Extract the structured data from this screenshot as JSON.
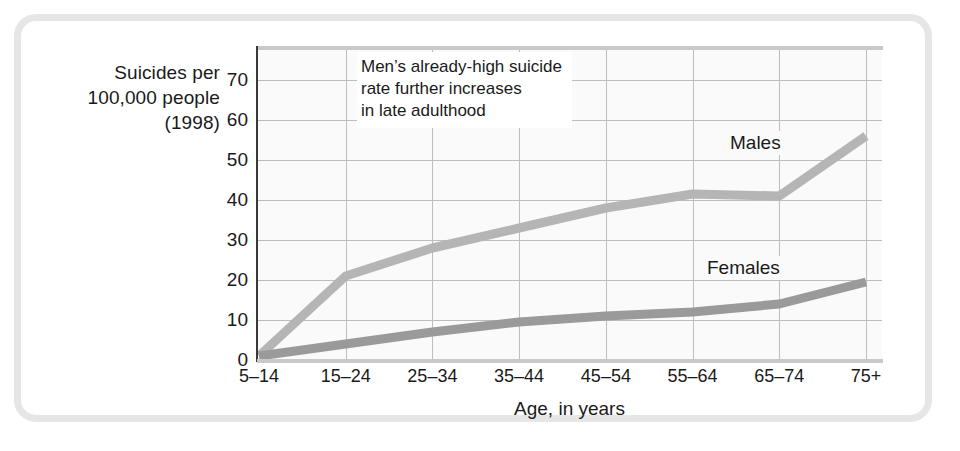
{
  "figure": {
    "y_axis_title_lines": [
      "Suicides per",
      "100,000 people",
      "(1998)"
    ],
    "x_axis_title": "Age, in years",
    "annotation_lines": [
      "Men’s already-high suicide",
      "rate further increases",
      "in late adulthood"
    ],
    "colors": {
      "males_line": "#b5b5b5",
      "females_line": "#9a9a9a",
      "grid": "#bdbdbd",
      "axis": "#3a3a3a",
      "plot_background": "#fafafa",
      "frame": "#e6e6e6",
      "text": "#1a1a1a"
    }
  },
  "chart_data": {
    "type": "line",
    "title": "",
    "subtitle": "",
    "xlabel": "Age, in years",
    "ylabel": "Suicides per 100,000 people (1998)",
    "categories": [
      "5–14",
      "15–24",
      "25–34",
      "35–44",
      "45–54",
      "55–64",
      "65–74",
      "75+"
    ],
    "yticks": [
      0,
      10,
      20,
      30,
      40,
      50,
      60,
      70
    ],
    "ylim": [
      0,
      78
    ],
    "grid": true,
    "legend": "inline-labels",
    "annotations": [
      {
        "text": "Men’s already-high suicide rate further increases in late adulthood",
        "x_category": "15–24",
        "y_value": 68
      }
    ],
    "series": [
      {
        "name": "Males",
        "label": "Males",
        "color": "#b5b5b5",
        "values": [
          1,
          21,
          28,
          33,
          38,
          41.5,
          41,
          56
        ]
      },
      {
        "name": "Females",
        "label": "Females",
        "color": "#9a9a9a",
        "values": [
          1,
          4,
          7,
          9.5,
          11,
          12,
          14,
          19.5
        ]
      }
    ]
  }
}
